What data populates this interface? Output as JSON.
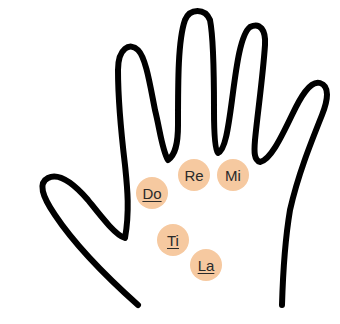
{
  "diagram": {
    "notes": [
      {
        "label": "Do",
        "underlined": true
      },
      {
        "label": "Re",
        "underlined": false
      },
      {
        "label": "Mi",
        "underlined": false
      },
      {
        "label": "Ti",
        "underlined": true
      },
      {
        "label": "La",
        "underlined": true
      }
    ],
    "colors": {
      "outline": "#000000",
      "note_fill": "#f6c9a0",
      "text": "#2a2a2a"
    }
  }
}
